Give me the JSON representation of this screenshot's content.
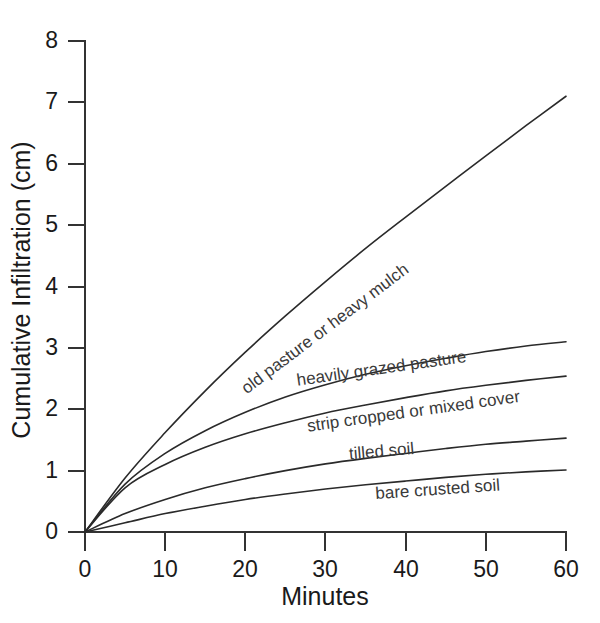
{
  "chart_data": {
    "type": "line",
    "title": "",
    "subtitle": "",
    "xlabel": "Minutes",
    "ylabel": "Cumulative Infiltration (cm)",
    "xlim": [
      0,
      60
    ],
    "ylim": [
      0,
      8
    ],
    "xticks": [
      "0",
      "10",
      "20",
      "30",
      "40",
      "50",
      "60"
    ],
    "yticks": [
      "0",
      "1",
      "2",
      "3",
      "4",
      "5",
      "6",
      "7",
      "8"
    ],
    "grid": false,
    "legend": "inline-curve-labels",
    "x": [
      0,
      5,
      10,
      15,
      20,
      25,
      30,
      35,
      40,
      45,
      50,
      55,
      60
    ],
    "series": [
      {
        "name": "old pasture or heavy mulch",
        "label": "old pasture or heavy mulch",
        "values": [
          0,
          0.88,
          1.62,
          2.3,
          2.93,
          3.52,
          4.08,
          4.62,
          5.13,
          5.63,
          6.13,
          6.62,
          7.1
        ]
      },
      {
        "name": "heavily grazed pasture",
        "label": "heavily grazed pasture",
        "values": [
          0,
          0.78,
          1.28,
          1.65,
          1.95,
          2.2,
          2.4,
          2.57,
          2.71,
          2.83,
          2.94,
          3.03,
          3.1
        ]
      },
      {
        "name": "strip cropped or mixed cover",
        "label": "strip cropped or mixed cover",
        "values": [
          0,
          0.72,
          1.1,
          1.38,
          1.6,
          1.78,
          1.94,
          2.07,
          2.19,
          2.3,
          2.39,
          2.47,
          2.54
        ]
      },
      {
        "name": "tilled soil",
        "label": "tilled soil",
        "values": [
          0,
          0.3,
          0.53,
          0.72,
          0.87,
          1.0,
          1.11,
          1.2,
          1.28,
          1.36,
          1.43,
          1.48,
          1.53
        ]
      },
      {
        "name": "bare crusted soil",
        "label": "bare crusted soil",
        "values": [
          0,
          0.15,
          0.3,
          0.42,
          0.53,
          0.62,
          0.7,
          0.77,
          0.83,
          0.89,
          0.94,
          0.98,
          1.01
        ]
      }
    ],
    "annotations": [
      {
        "text": "old pasture or heavy mulch",
        "x": 30,
        "y": 3.3,
        "rotation": -37
      },
      {
        "text": "heavily grazed pasture",
        "x": 37,
        "y": 2.65,
        "rotation": -8
      },
      {
        "text": "strip cropped or mixed cover",
        "x": 41,
        "y": 1.95,
        "rotation": -8
      },
      {
        "text": "tilled soil",
        "x": 37,
        "y": 1.3,
        "rotation": -5
      },
      {
        "text": "bare crusted soil",
        "x": 44,
        "y": 0.68,
        "rotation": -4
      }
    ],
    "colors": {
      "curve": "#2a2a2a",
      "axis": "#333333",
      "text": "#1a1a1a",
      "label": "#3a3a3a",
      "background": "#ffffff"
    }
  }
}
